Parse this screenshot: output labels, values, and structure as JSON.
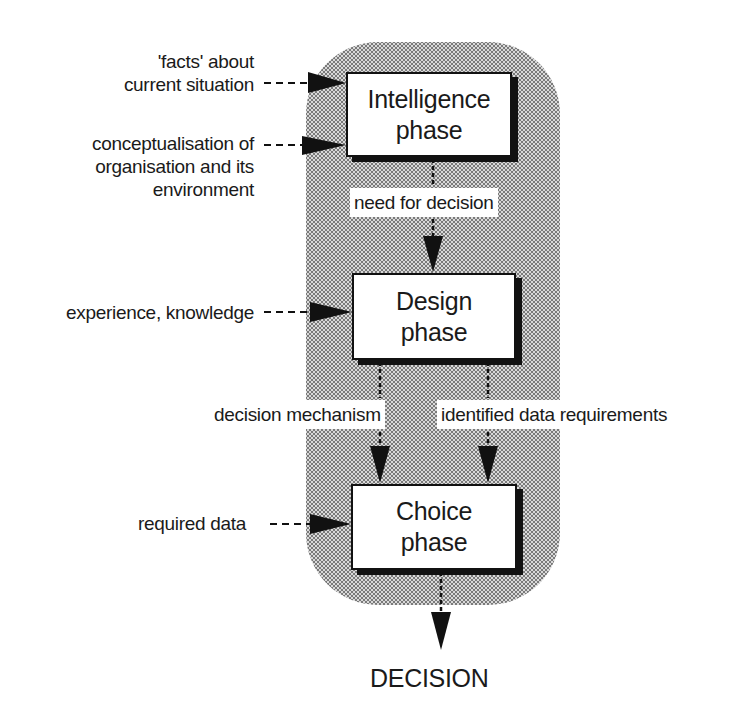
{
  "diagram": {
    "type": "flowchart",
    "title": "",
    "phases": [
      {
        "id": "intelligence",
        "line1": "Intelligence",
        "line2": "phase"
      },
      {
        "id": "design",
        "line1": "Design",
        "line2": "phase"
      },
      {
        "id": "choice",
        "line1": "Choice",
        "line2": "phase"
      }
    ],
    "inputs": {
      "facts_line1": "'facts' about",
      "facts_line2": "current situation",
      "concept_line1": "conceptualisation of",
      "concept_line2": "organisation and its",
      "concept_line3": "environment",
      "experience": "experience, knowledge",
      "required_data": "required data"
    },
    "flows": {
      "need_for_decision": "need for decision",
      "decision_mechanism": "decision mechanism",
      "identified_data_requirements": "identified data requirements"
    },
    "output": "DECISION",
    "colors": {
      "shade_background": "#d9d9d9",
      "shade_dots": "#7a7a7a",
      "box_border": "#111111",
      "box_fill": "#ffffff"
    }
  }
}
